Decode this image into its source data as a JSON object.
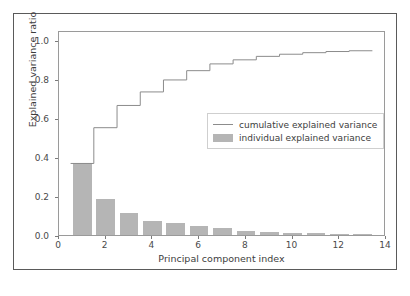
{
  "chart_data": {
    "type": "bar",
    "title": "",
    "subtitle": "",
    "xlabel": "Principal component index",
    "ylabel": "Explained variance ratio",
    "xlim": [
      0,
      14
    ],
    "ylim": [
      0.0,
      1.05
    ],
    "xticks": [
      0,
      2,
      4,
      6,
      8,
      10,
      12,
      14
    ],
    "xtick_labels": [
      "0",
      "2",
      "4",
      "6",
      "8",
      "10",
      "12",
      "14"
    ],
    "yticks": [
      0.0,
      0.2,
      0.4,
      0.6,
      0.8,
      1.0
    ],
    "ytick_labels": [
      "0.0",
      "0.2",
      "0.4",
      "0.6",
      "0.8",
      "1.0"
    ],
    "grid": false,
    "legend_position": "center-right",
    "categories": [
      1,
      2,
      3,
      4,
      5,
      6,
      7,
      8,
      9,
      10,
      11,
      12,
      13
    ],
    "series": [
      {
        "name": "individual explained variance",
        "type": "bar",
        "color": "#b5b5b5",
        "values": [
          0.37,
          0.185,
          0.115,
          0.07,
          0.062,
          0.048,
          0.035,
          0.021,
          0.018,
          0.011,
          0.008,
          0.006,
          0.004
        ]
      },
      {
        "name": "cumulative explained variance",
        "type": "step",
        "color": "#8c8c8c",
        "values": [
          0.37,
          0.555,
          0.67,
          0.74,
          0.802,
          0.85,
          0.885,
          0.906,
          0.924,
          0.935,
          0.943,
          0.949,
          0.953
        ]
      }
    ]
  },
  "legend": {
    "items": [
      {
        "label": "cumulative explained variance",
        "marker": "line"
      },
      {
        "label": "individual explained variance",
        "marker": "patch"
      }
    ]
  },
  "colors": {
    "bar_fill": "#b5b5b5",
    "line": "#8c8c8c",
    "axis": "#9a9a9a",
    "text": "#3d3d3d",
    "background": "#ffffff",
    "figure_border": "#5a5a5a"
  }
}
